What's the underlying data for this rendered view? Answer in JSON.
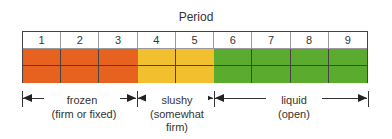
{
  "title": "Period",
  "periods": [
    "1",
    "2",
    "3",
    "4",
    "5",
    "6",
    "7",
    "8",
    "9"
  ],
  "colors": {
    "frozen": "#e8621f",
    "slushy": "#f2c02e",
    "liquid": "#5aab2e",
    "grid_line": "#444444"
  },
  "zones": [
    {
      "name": "frozen",
      "label_line1": "frozen",
      "label_line2": "(firm or fixed)",
      "label_line3": "",
      "periods": [
        1,
        2,
        3
      ]
    },
    {
      "name": "slushy",
      "label_line1": "slushy",
      "label_line2": "(somewhat",
      "label_line3": "firm)",
      "periods": [
        4,
        5
      ]
    },
    {
      "name": "liquid",
      "label_line1": "liquid",
      "label_line2": "(open)",
      "label_line3": "",
      "periods": [
        6,
        7,
        8,
        9
      ]
    }
  ]
}
